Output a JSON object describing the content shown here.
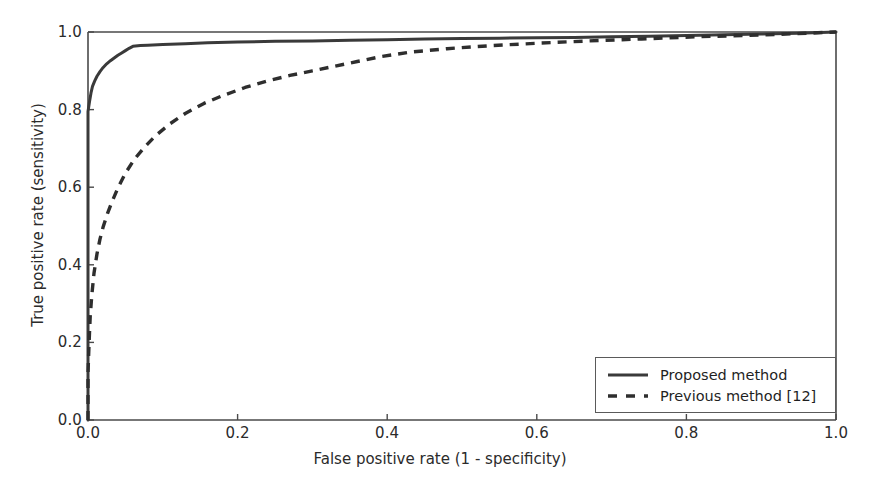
{
  "chart_data": {
    "type": "line",
    "title": "",
    "xlabel": "False positive rate (1 - specificity)",
    "ylabel": "True positive rate (sensitivity)",
    "xlim": [
      0.0,
      1.0
    ],
    "ylim": [
      0.0,
      1.0
    ],
    "grid": false,
    "legend_position": "lower right",
    "xticks": [
      "0.0",
      "0.2",
      "0.4",
      "0.6",
      "0.8",
      "1.0"
    ],
    "xtick_values": [
      0.0,
      0.2,
      0.4,
      0.6,
      0.8,
      1.0
    ],
    "yticks": [
      "0.0",
      "0.2",
      "0.4",
      "0.6",
      "0.8",
      "1.0"
    ],
    "ytick_values": [
      0.0,
      0.2,
      0.4,
      0.6,
      0.8,
      1.0
    ],
    "series": [
      {
        "name": "Proposed method",
        "style": "solid",
        "color": "#3a3a3a",
        "x": [
          0.0,
          0.0,
          0.002,
          0.004,
          0.006,
          0.009,
          0.012,
          0.016,
          0.02,
          0.025,
          0.03,
          0.035,
          0.04,
          0.045,
          0.05,
          0.055,
          0.06,
          0.07,
          0.08,
          0.1,
          0.13,
          0.16,
          0.2,
          0.25,
          0.3,
          0.35,
          0.4,
          0.45,
          0.5,
          0.55,
          0.6,
          0.65,
          0.7,
          0.75,
          0.8,
          0.85,
          0.9,
          0.95,
          1.0
        ],
        "y": [
          0.0,
          0.795,
          0.82,
          0.843,
          0.86,
          0.874,
          0.886,
          0.898,
          0.908,
          0.918,
          0.926,
          0.933,
          0.94,
          0.946,
          0.952,
          0.958,
          0.963,
          0.965,
          0.966,
          0.968,
          0.97,
          0.972,
          0.974,
          0.976,
          0.977,
          0.979,
          0.98,
          0.982,
          0.983,
          0.984,
          0.985,
          0.986,
          0.988,
          0.989,
          0.991,
          0.993,
          0.995,
          0.997,
          1.0
        ]
      },
      {
        "name": "Previous method [12]",
        "style": "dashed",
        "color": "#2e2e2e",
        "x": [
          0.0,
          0.0,
          0.001,
          0.002,
          0.003,
          0.005,
          0.008,
          0.012,
          0.016,
          0.02,
          0.026,
          0.032,
          0.04,
          0.05,
          0.062,
          0.075,
          0.09,
          0.11,
          0.13,
          0.155,
          0.18,
          0.21,
          0.24,
          0.27,
          0.3,
          0.33,
          0.36,
          0.39,
          0.43,
          0.48,
          0.54,
          0.6,
          0.67,
          0.74,
          0.82,
          0.9,
          1.0
        ],
        "y": [
          0.0,
          0.12,
          0.175,
          0.225,
          0.268,
          0.32,
          0.378,
          0.428,
          0.466,
          0.496,
          0.532,
          0.562,
          0.598,
          0.636,
          0.672,
          0.702,
          0.732,
          0.764,
          0.79,
          0.816,
          0.836,
          0.857,
          0.874,
          0.888,
          0.9,
          0.912,
          0.924,
          0.936,
          0.948,
          0.957,
          0.965,
          0.971,
          0.977,
          0.982,
          0.988,
          0.992,
          1.0
        ]
      }
    ]
  },
  "legend": {
    "items": [
      {
        "label": "Proposed method",
        "style": "solid"
      },
      {
        "label": "Previous method [12]",
        "style": "dashed"
      }
    ]
  }
}
